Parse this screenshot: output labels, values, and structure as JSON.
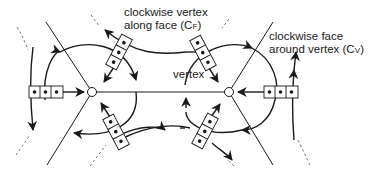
{
  "diagram": {
    "labels": {
      "cf_line1": "clockwise vertex",
      "cf_line2_prefix": "along face (C",
      "cf_sub": "F",
      "cf_suffix": ")",
      "cv_line1": "clockwise face",
      "cv_line2_prefix": "around vertex (C",
      "cv_sub": "V",
      "cv_suffix": ")",
      "vertex": "vertex"
    },
    "colors": {
      "stroke": "#1a1a1a",
      "dashed": "#666666",
      "background": "#ffffff"
    },
    "vertices": [
      {
        "name": "left-vertex",
        "x": 92,
        "y": 92
      },
      {
        "name": "right-vertex",
        "x": 229,
        "y": 92
      }
    ],
    "triple_boxes": [
      {
        "name": "left-horizontal",
        "cx": 46,
        "cy": 92,
        "angle": 0
      },
      {
        "name": "right-horizontal",
        "cx": 281,
        "cy": 92,
        "angle": 0
      },
      {
        "name": "top-left-diagonal",
        "cx": 121,
        "cy": 53,
        "angle": -62
      },
      {
        "name": "top-right-diagonal",
        "cx": 201,
        "cy": 53,
        "angle": 62
      },
      {
        "name": "bottom-left-diagonal",
        "cx": 116,
        "cy": 131,
        "angle": 62
      },
      {
        "name": "bottom-right-diagonal",
        "cx": 205,
        "cy": 131,
        "angle": -62
      }
    ]
  }
}
